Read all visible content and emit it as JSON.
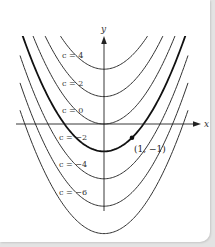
{
  "figure": {
    "axes": {
      "x_label": "x",
      "y_label": "y"
    },
    "curves": [
      {
        "c": 4,
        "label": "c = 4",
        "highlight": false
      },
      {
        "c": 2,
        "label": "c = 2",
        "highlight": false
      },
      {
        "c": 0,
        "label": "c = 0",
        "highlight": false
      },
      {
        "c": -2,
        "label": "c = −2",
        "highlight": true
      },
      {
        "c": -4,
        "label": "c = −4",
        "highlight": false
      },
      {
        "c": -6,
        "label": "c = −6",
        "highlight": false
      },
      {
        "c": -8,
        "label": "",
        "highlight": false
      }
    ],
    "point": {
      "x": 1,
      "y": -1,
      "label": "(1, −1)"
    }
  },
  "colors": {
    "curve": "#333333",
    "highlight": "#111111",
    "background": "#ffffff",
    "frame": "#e3e3e3"
  }
}
